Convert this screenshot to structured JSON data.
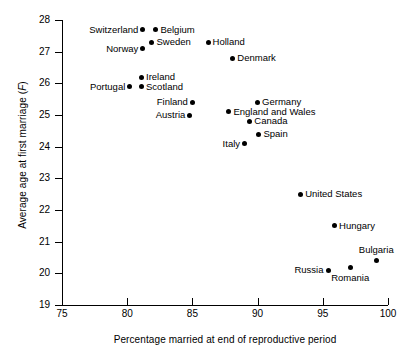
{
  "chart_data": {
    "type": "scatter",
    "title": "",
    "xlabel": "Percentage married at end of reproductive period",
    "ylabel": "Average age at first marriage (F)",
    "xlim": [
      75,
      100
    ],
    "ylim": [
      19,
      28
    ],
    "xticks": [
      75,
      80,
      85,
      90,
      95,
      100
    ],
    "yticks": [
      19,
      20,
      21,
      22,
      23,
      24,
      25,
      26,
      27,
      28
    ],
    "grid": false,
    "legend": "none",
    "marker": "filled-circle",
    "points": [
      {
        "label": "Switzerland",
        "x": 81.2,
        "y": 27.7,
        "label_pos": "left"
      },
      {
        "label": "Belgium",
        "x": 82.2,
        "y": 27.7,
        "label_pos": "right"
      },
      {
        "label": "Sweden",
        "x": 81.9,
        "y": 27.3,
        "label_pos": "right"
      },
      {
        "label": "Norway",
        "x": 81.2,
        "y": 27.1,
        "label_pos": "left"
      },
      {
        "label": "Holland",
        "x": 86.2,
        "y": 27.3,
        "label_pos": "right"
      },
      {
        "label": "Denmark",
        "x": 88.1,
        "y": 26.8,
        "label_pos": "right"
      },
      {
        "label": "Ireland",
        "x": 81.1,
        "y": 26.2,
        "label_pos": "right"
      },
      {
        "label": "Portugal",
        "x": 80.2,
        "y": 25.9,
        "label_pos": "left"
      },
      {
        "label": "Scotland",
        "x": 81.1,
        "y": 25.9,
        "label_pos": "right"
      },
      {
        "label": "Finland",
        "x": 85.0,
        "y": 25.4,
        "label_pos": "left"
      },
      {
        "label": "Austria",
        "x": 84.8,
        "y": 25.0,
        "label_pos": "left"
      },
      {
        "label": "Germany",
        "x": 90.0,
        "y": 25.4,
        "label_pos": "right"
      },
      {
        "label": "England and Wales",
        "x": 87.8,
        "y": 25.1,
        "label_pos": "right"
      },
      {
        "label": "Canada",
        "x": 89.4,
        "y": 24.8,
        "label_pos": "right"
      },
      {
        "label": "Spain",
        "x": 90.1,
        "y": 24.4,
        "label_pos": "right"
      },
      {
        "label": "Italy",
        "x": 89.0,
        "y": 24.1,
        "label_pos": "left"
      },
      {
        "label": "United States",
        "x": 93.3,
        "y": 22.5,
        "label_pos": "right"
      },
      {
        "label": "Hungary",
        "x": 95.9,
        "y": 21.5,
        "label_pos": "right"
      },
      {
        "label": "Bulgaria",
        "x": 99.1,
        "y": 20.4,
        "label_pos": "above"
      },
      {
        "label": "Romania",
        "x": 97.1,
        "y": 20.2,
        "label_pos": "below"
      },
      {
        "label": "Russia",
        "x": 95.4,
        "y": 20.1,
        "label_pos": "left"
      }
    ]
  },
  "axes": {
    "x_tick_labels": [
      "75",
      "80",
      "85",
      "90",
      "95",
      "100"
    ],
    "y_tick_labels": [
      "19",
      "20",
      "21",
      "22",
      "23",
      "24",
      "25",
      "26",
      "27",
      "28"
    ],
    "x_axis_title": "Percentage married at end of reproductive period",
    "y_axis_title_prefix": "Average age at first marriage (",
    "y_axis_title_italic": "F",
    "y_axis_title_suffix": ")"
  },
  "style": {
    "background": "#ffffff",
    "foreground": "#000000",
    "marker_color": "#000000"
  }
}
